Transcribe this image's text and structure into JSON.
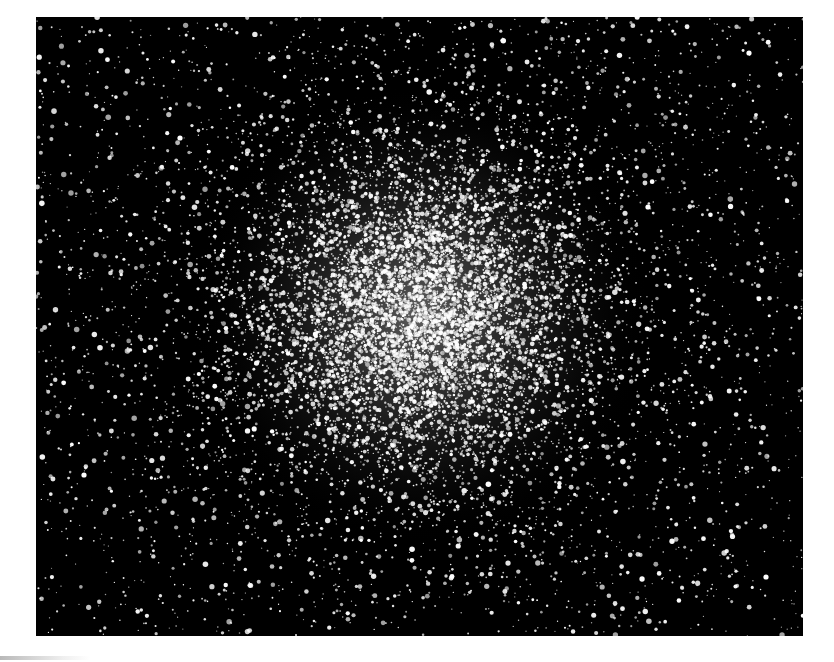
{
  "image": {
    "subject": "Globular star cluster",
    "description": "Black-and-white astronomical photograph of a dense globular star cluster with a bright, crowded core and a sparse field of stars toward the edges",
    "frame": {
      "x": 36,
      "y": 17,
      "width": 767,
      "height": 619
    },
    "colors": {
      "sky": "#000000",
      "stars": "#ffffff",
      "page": "#ffffff"
    },
    "cluster_center": {
      "x": 385,
      "y": 298
    },
    "core_radius": 150,
    "field_star_count": 2600,
    "cluster_star_count": 9000
  }
}
